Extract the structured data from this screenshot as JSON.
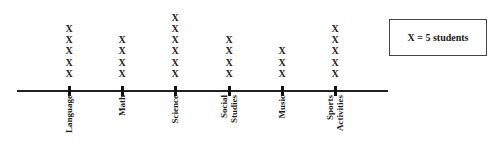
{
  "chart_data": {
    "type": "dot-plot",
    "title": "",
    "xlabel": "",
    "ylabel": "",
    "categories": [
      "Language",
      "Math",
      "Science",
      "Social Studies",
      "Music",
      "Sports Activities"
    ],
    "category_labels": [
      "Language",
      "Math",
      "Science",
      "Social\nStudies",
      "Music",
      "Sports\nActivities"
    ],
    "marks": [
      5,
      4,
      6,
      4,
      3,
      5
    ],
    "values": [
      25,
      20,
      30,
      20,
      15,
      25
    ],
    "mark_symbol": "X",
    "scale": 5,
    "legend": {
      "text": "X = 5 students",
      "position": "top-right"
    },
    "grid": false
  },
  "legend": {
    "text": "X = 5 students"
  }
}
